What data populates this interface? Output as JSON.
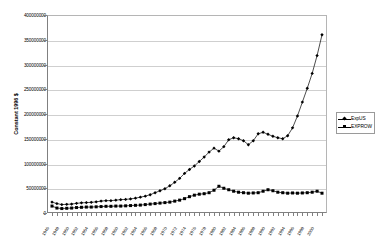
{
  "chart_data": {
    "type": "line",
    "title": "",
    "xlabel": "",
    "ylabel": "Constant 1996 $",
    "ylim": [
      0,
      400000000
    ],
    "ytick_values": [
      0,
      50000000,
      100000000,
      150000000,
      200000000,
      250000000,
      300000000,
      350000000,
      400000000
    ],
    "ytick_labels": [
      "0",
      "50000000",
      "100000000",
      "150000000",
      "200000000",
      "250000000",
      "300000000",
      "350000000",
      "400000000"
    ],
    "grid": true,
    "legend_position": "right",
    "categories": [
      "1946",
      "1947",
      "1948",
      "1949",
      "1950",
      "1951",
      "1952",
      "1953",
      "1954",
      "1955",
      "1956",
      "1957",
      "1958",
      "1959",
      "1960",
      "1961",
      "1962",
      "1963",
      "1964",
      "1965",
      "1966",
      "1967",
      "1968",
      "1969",
      "1970",
      "1971",
      "1972",
      "1973",
      "1974",
      "1975",
      "1976",
      "1977",
      "1978",
      "1979",
      "1980",
      "1981",
      "1982",
      "1983",
      "1984",
      "1985",
      "1986",
      "1987",
      "1988",
      "1989",
      "1990",
      "1991",
      "1992",
      "1993",
      "1994",
      "1995",
      "1996",
      "1997",
      "1998",
      "1999",
      "2000",
      "2001"
    ],
    "xtick_labels": [
      "1946",
      "1948",
      "1950",
      "1952",
      "1954",
      "1956",
      "1958",
      "1960",
      "1962",
      "1964",
      "1966",
      "1968",
      "1970",
      "1972",
      "1974",
      "1976",
      "1978",
      "1980",
      "1982",
      "1984",
      "1986",
      "1988",
      "1990",
      "1992",
      "1994",
      "1996",
      "1998",
      "2000"
    ],
    "series": [
      {
        "name": "ExpUS",
        "marker": "diamond",
        "color": "#000000",
        "values": [
          22000000,
          19000000,
          17000000,
          17500000,
          18000000,
          19500000,
          20500000,
          21000000,
          21500000,
          22500000,
          24000000,
          25000000,
          25000000,
          26000000,
          27000000,
          27500000,
          28500000,
          30000000,
          32000000,
          34000000,
          37000000,
          41000000,
          45000000,
          49000000,
          55000000,
          62000000,
          70000000,
          80000000,
          88000000,
          95000000,
          104000000,
          113000000,
          123000000,
          131000000,
          125000000,
          134000000,
          148000000,
          152000000,
          150000000,
          146000000,
          138000000,
          146000000,
          160000000,
          163000000,
          159000000,
          155000000,
          152000000,
          150000000,
          156000000,
          172000000,
          196000000,
          224000000,
          252000000,
          282000000,
          318000000,
          360000000
        ]
      },
      {
        "name": "EXPROW",
        "marker": "square",
        "color": "#000000",
        "values": [
          14000000,
          10000000,
          9000000,
          9500000,
          10000000,
          11000000,
          11500000,
          12000000,
          12000000,
          12500000,
          13000000,
          13500000,
          13500000,
          14000000,
          14000000,
          14500000,
          15000000,
          15500000,
          16000000,
          17000000,
          18000000,
          19000000,
          20000000,
          21000000,
          22000000,
          24000000,
          26000000,
          29000000,
          33000000,
          36000000,
          38000000,
          39000000,
          41000000,
          46000000,
          54000000,
          50000000,
          47000000,
          44000000,
          42000000,
          41000000,
          40000000,
          40500000,
          41000000,
          44000000,
          47000000,
          45000000,
          42000000,
          41000000,
          40000000,
          40500000,
          40000000,
          40500000,
          41000000,
          42000000,
          44000000,
          40000000
        ]
      }
    ],
    "final_ExpUS_point": 330000000,
    "final_EXPROW_point": 40000000
  },
  "legend": {
    "items": [
      {
        "label": "ExpUS"
      },
      {
        "label": "EXPROW"
      }
    ]
  }
}
